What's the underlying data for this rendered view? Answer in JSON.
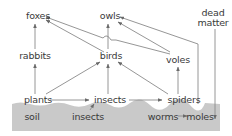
{
  "diagram": {
    "type": "food-web",
    "colors": {
      "background": "#ffffff",
      "soil": "#c9c9c9",
      "line": "#8a8a8a",
      "text": "#3a3a3a"
    },
    "nodes": {
      "foxes": "foxes",
      "owls": "owls",
      "dead_matter_line1": "dead",
      "dead_matter_line2": "matter",
      "rabbits": "rabbits",
      "birds": "birds",
      "voles": "voles",
      "plants": "plants",
      "insects_above": "insects",
      "spiders": "spiders",
      "soil": "soil",
      "insects_soil": "insects",
      "worms": "worms",
      "moles": "moles"
    },
    "edges": [
      {
        "from": "rabbits",
        "to": "foxes"
      },
      {
        "from": "birds",
        "to": "foxes"
      },
      {
        "from": "voles",
        "to": "foxes"
      },
      {
        "from": "birds",
        "to": "owls"
      },
      {
        "from": "voles",
        "to": "owls"
      },
      {
        "from": "moles",
        "to": "owls"
      },
      {
        "from": "plants",
        "to": "rabbits"
      },
      {
        "from": "plants",
        "to": "birds"
      },
      {
        "from": "insects",
        "to": "birds"
      },
      {
        "from": "spiders",
        "to": "birds"
      },
      {
        "from": "spiders",
        "to": "voles"
      },
      {
        "from": "plants",
        "to": "insects"
      },
      {
        "from": "insects",
        "to": "spiders"
      },
      {
        "from": "soil insects",
        "to": "insects"
      },
      {
        "from": "worms",
        "to": "moles"
      },
      {
        "from": "dead matter",
        "to": "moles"
      }
    ]
  }
}
